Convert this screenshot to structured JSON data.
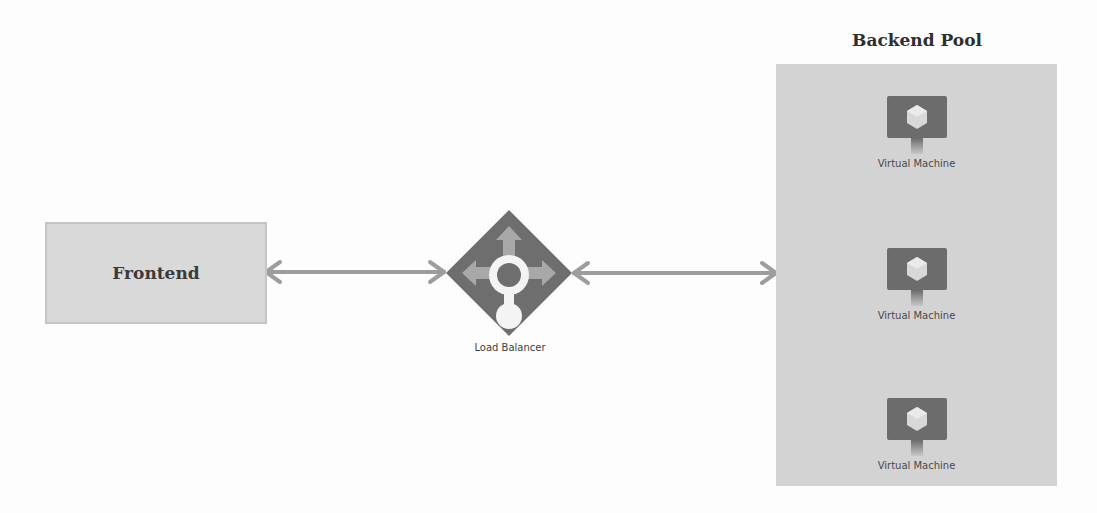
{
  "diagram": {
    "frontend": {
      "label": "Frontend"
    },
    "load_balancer": {
      "label": "Load Balancer",
      "icon": "load-balancer-icon"
    },
    "backend_pool": {
      "title": "Backend Pool",
      "vms": [
        {
          "label": "Virtual Machine",
          "icon": "virtual-machine-icon"
        },
        {
          "label": "Virtual Machine",
          "icon": "virtual-machine-icon"
        },
        {
          "label": "Virtual Machine",
          "icon": "virtual-machine-icon"
        }
      ]
    },
    "connections": [
      {
        "from": "Frontend",
        "to": "Load Balancer",
        "type": "bidirectional"
      },
      {
        "from": "Load Balancer",
        "to": "Backend Pool",
        "type": "bidirectional"
      }
    ],
    "colors": {
      "background": "#fdfdfd",
      "frontend_fill": "#d9d9d9",
      "backend_fill": "#d3d3d3",
      "arrow": "#9a9a9a",
      "icon_dark": "#6b6b6b",
      "icon_light": "#a9a9a9"
    }
  }
}
